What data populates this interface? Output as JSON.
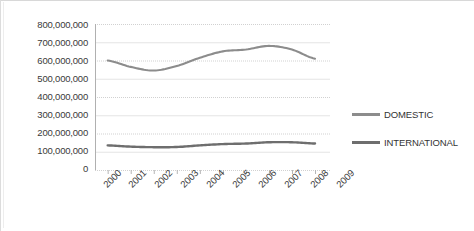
{
  "chart_data": {
    "type": "line",
    "title": "",
    "subtitle": "",
    "xlabel": "",
    "ylabel": "",
    "categories": [
      "2000",
      "2001",
      "2002",
      "2003",
      "2004",
      "2005",
      "2006",
      "2007",
      "2008",
      "2009"
    ],
    "x": [
      2000,
      2001,
      2002,
      2003,
      2004,
      2005,
      2006,
      2007,
      2008,
      2009
    ],
    "ylim": [
      0,
      800000000
    ],
    "ytick_values": [
      0,
      100000000,
      200000000,
      300000000,
      400000000,
      500000000,
      600000000,
      700000000,
      800000000
    ],
    "ytick_labels": [
      "0",
      "100,000,000",
      "200,000,000",
      "300,000,000",
      "400,000,000",
      "500,000,000",
      "600,000,000",
      "700,000,000",
      "800,000,000"
    ],
    "grid": true,
    "grid_axis": "y",
    "legend_position": "right",
    "series": [
      {
        "name": "DOMESTIC",
        "color": "#8c8c8c",
        "values": [
          600000000,
          565000000,
          545000000,
          570000000,
          615000000,
          650000000,
          660000000,
          680000000,
          660000000,
          610000000
        ]
      },
      {
        "name": "INTERNATIONAL",
        "color": "#6e6e6e",
        "values": [
          135000000,
          128000000,
          125000000,
          126000000,
          135000000,
          142000000,
          145000000,
          152000000,
          152000000,
          145000000
        ]
      }
    ]
  },
  "yaxis": {
    "labels": [
      "800,000,000",
      "700,000,000",
      "600,000,000",
      "500,000,000",
      "400,000,000",
      "300,000,000",
      "200,000,000",
      "100,000,000",
      "0"
    ]
  },
  "xaxis": {
    "labels": [
      "2000",
      "2001",
      "2002",
      "2003",
      "2004",
      "2005",
      "2006",
      "2007",
      "2008",
      "2009"
    ]
  },
  "legend": {
    "items": [
      {
        "label": "DOMESTIC",
        "color": "#8c8c8c"
      },
      {
        "label": "INTERNATIONAL",
        "color": "#6e6e6e"
      }
    ]
  },
  "colors": {
    "background": "#ffffff",
    "grid": "#cfcfcf",
    "axis": "#b5b5b5",
    "text": "#3a3a3a",
    "domestic": "#8c8c8c",
    "international": "#6e6e6e"
  }
}
